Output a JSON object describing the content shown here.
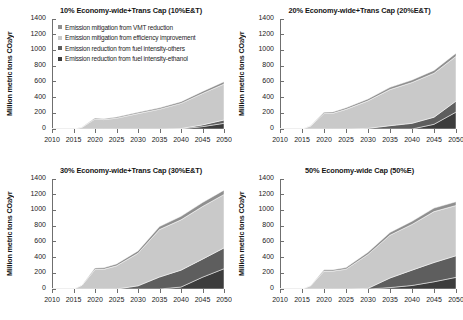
{
  "figure": {
    "ylabel": "Million metric tons CO",
    "ylabel_sub": "2",
    "ylabel_tail": "/yr",
    "ylabel_full": "Million metric tons CO2/yr",
    "xlabel": "",
    "yticks": [
      0,
      200,
      400,
      600,
      800,
      1000,
      1200,
      1400
    ],
    "xticks": [
      2010,
      2015,
      2020,
      2025,
      2030,
      2035,
      2040,
      2045,
      2050
    ],
    "ylim": [
      0,
      1400
    ],
    "xlim": [
      2010,
      2050
    ],
    "grid": false,
    "colors": {
      "vmt": "#8f8f8f",
      "efficiency": "#c9c9c9",
      "others": "#5e5e5e",
      "ethanol": "#3c3c3c",
      "axis": "#6f6f6f",
      "text": "#1a1a1a",
      "background": "#ffffff"
    }
  },
  "legend": {
    "position": "inside-top-left",
    "panel": "10%E&T",
    "entries": [
      {
        "label": "Emission mitigation from VMT reduction",
        "key": "vmt",
        "color": "#8f8f8f"
      },
      {
        "label": "Emission mitigation from efficiency improvement",
        "key": "efficiency",
        "color": "#c9c9c9"
      },
      {
        "label": "Emission reduction from fuel intensity-others",
        "key": "others",
        "color": "#5e5e5e"
      },
      {
        "label": "Emission reduction from fuel intensity-ethanol",
        "key": "ethanol",
        "color": "#3c3c3c"
      }
    ]
  },
  "chart_data": [
    {
      "type": "area",
      "id": "panel-10",
      "title": "10% Economy-wide+Trans Cap (10%E&T)",
      "xlabel": "",
      "ylabel": "Million metric tons CO2/yr",
      "xlim": [
        2010,
        2050
      ],
      "ylim": [
        0,
        1400
      ],
      "x": [
        2010,
        2015,
        2017,
        2020,
        2022,
        2025,
        2030,
        2035,
        2040,
        2045,
        2050
      ],
      "stack_order_bottom_to_top": [
        "ethanol",
        "others",
        "efficiency",
        "vmt"
      ],
      "series": [
        {
          "name": "Emission reduction from fuel intensity-ethanol",
          "key": "ethanol",
          "values": [
            0,
            0,
            0,
            0,
            0,
            0,
            0,
            0,
            2,
            30,
            72
          ]
        },
        {
          "name": "Emission reduction from fuel intensity-others",
          "key": "others",
          "values": [
            0,
            0,
            0,
            0,
            0,
            0,
            0,
            0,
            4,
            22,
            42
          ]
        },
        {
          "name": "Emission mitigation from efficiency improvement",
          "key": "efficiency",
          "values": [
            0,
            0,
            22,
            128,
            120,
            138,
            196,
            252,
            320,
            400,
            458
          ]
        },
        {
          "name": "Emission mitigation from VMT reduction",
          "key": "vmt",
          "values": [
            0,
            0,
            2,
            12,
            12,
            14,
            16,
            18,
            22,
            26,
            30
          ]
        }
      ],
      "totals": [
        0,
        0,
        24,
        140,
        132,
        152,
        212,
        270,
        348,
        478,
        602
      ]
    },
    {
      "type": "area",
      "id": "panel-20",
      "title": "20% Economy-wide+Trans Cap (20%E&T)",
      "xlabel": "",
      "ylabel": "Million metric tons CO2/yr",
      "xlim": [
        2010,
        2050
      ],
      "ylim": [
        0,
        1400
      ],
      "x": [
        2010,
        2015,
        2017,
        2020,
        2022,
        2025,
        2030,
        2035,
        2040,
        2045,
        2050
      ],
      "stack_order_bottom_to_top": [
        "ethanol",
        "others",
        "efficiency",
        "vmt"
      ],
      "series": [
        {
          "name": "Emission reduction from fuel intensity-ethanol",
          "key": "ethanol",
          "values": [
            0,
            0,
            0,
            0,
            0,
            0,
            0,
            0,
            0,
            60,
            215
          ]
        },
        {
          "name": "Emission reduction from fuel intensity-others",
          "key": "others",
          "values": [
            0,
            0,
            0,
            0,
            0,
            0,
            8,
            42,
            72,
            90,
            140
          ]
        },
        {
          "name": "Emission mitigation from efficiency improvement",
          "key": "efficiency",
          "values": [
            0,
            0,
            40,
            198,
            200,
            250,
            350,
            460,
            520,
            560,
            570
          ]
        },
        {
          "name": "Emission mitigation from VMT reduction",
          "key": "vmt",
          "values": [
            0,
            0,
            3,
            16,
            17,
            20,
            24,
            28,
            32,
            36,
            40
          ]
        }
      ],
      "totals": [
        0,
        0,
        43,
        214,
        217,
        270,
        382,
        530,
        624,
        746,
        965
      ]
    },
    {
      "type": "area",
      "id": "panel-30",
      "title": "30% Economy-wide+Trans Cap (30%E&T)",
      "xlabel": "",
      "ylabel": "Million metric tons CO2/yr",
      "xlim": [
        2010,
        2050
      ],
      "ylim": [
        0,
        1400
      ],
      "x": [
        2010,
        2015,
        2017,
        2020,
        2022,
        2025,
        2030,
        2035,
        2040,
        2045,
        2050
      ],
      "stack_order_bottom_to_top": [
        "ethanol",
        "others",
        "efficiency",
        "vmt"
      ],
      "series": [
        {
          "name": "Emission reduction from fuel intensity-ethanol",
          "key": "ethanol",
          "values": [
            0,
            0,
            0,
            0,
            0,
            0,
            0,
            0,
            25,
            150,
            258
          ]
        },
        {
          "name": "Emission reduction from fuel intensity-others",
          "key": "others",
          "values": [
            0,
            0,
            0,
            0,
            0,
            0,
            40,
            152,
            215,
            230,
            265
          ]
        },
        {
          "name": "Emission mitigation from efficiency improvement",
          "key": "efficiency",
          "values": [
            0,
            0,
            48,
            248,
            250,
            295,
            415,
            605,
            640,
            670,
            680
          ]
        },
        {
          "name": "Emission mitigation from VMT reduction",
          "key": "vmt",
          "values": [
            0,
            0,
            4,
            18,
            20,
            24,
            30,
            38,
            45,
            50,
            55
          ]
        }
      ],
      "totals": [
        0,
        0,
        52,
        266,
        270,
        319,
        485,
        795,
        925,
        1100,
        1258
      ]
    },
    {
      "type": "area",
      "id": "panel-50",
      "title": "50% Economy-wide Cap (50%E)",
      "xlabel": "",
      "ylabel": "Million metric tons CO2/yr",
      "xlim": [
        2010,
        2050
      ],
      "ylim": [
        0,
        1400
      ],
      "x": [
        2010,
        2015,
        2017,
        2020,
        2022,
        2025,
        2030,
        2035,
        2040,
        2045,
        2050
      ],
      "stack_order_bottom_to_top": [
        "ethanol",
        "others",
        "efficiency",
        "vmt"
      ],
      "series": [
        {
          "name": "Emission reduction from fuel intensity-ethanol",
          "key": "ethanol",
          "values": [
            0,
            0,
            0,
            0,
            0,
            0,
            0,
            18,
            45,
            92,
            148
          ]
        },
        {
          "name": "Emission reduction from fuel intensity-others",
          "key": "others",
          "values": [
            0,
            0,
            0,
            0,
            0,
            0,
            8,
            122,
            195,
            245,
            275
          ]
        },
        {
          "name": "Emission mitigation from efficiency improvement",
          "key": "efficiency",
          "values": [
            0,
            0,
            42,
            228,
            228,
            252,
            432,
            545,
            582,
            648,
            640
          ]
        },
        {
          "name": "Emission mitigation from VMT reduction",
          "key": "vmt",
          "values": [
            0,
            0,
            4,
            17,
            18,
            21,
            28,
            35,
            40,
            45,
            48
          ]
        }
      ],
      "totals": [
        0,
        0,
        46,
        245,
        246,
        273,
        468,
        720,
        862,
        1030,
        1111
      ]
    }
  ]
}
